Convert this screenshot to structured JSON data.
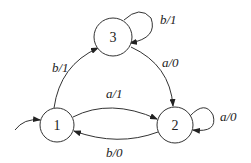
{
  "diagram": {
    "type": "finite-state-machine",
    "states": [
      {
        "id": "1",
        "label": "1",
        "initial": true
      },
      {
        "id": "2",
        "label": "2"
      },
      {
        "id": "3",
        "label": "3"
      }
    ],
    "transitions": [
      {
        "from": "1",
        "to": "3",
        "label": "b/1"
      },
      {
        "from": "3",
        "to": "3",
        "label": "b/1"
      },
      {
        "from": "3",
        "to": "2",
        "label": "a/0"
      },
      {
        "from": "1",
        "to": "2",
        "label": "a/1"
      },
      {
        "from": "2",
        "to": "2",
        "label": "a/0"
      },
      {
        "from": "2",
        "to": "1",
        "label": "b/0"
      }
    ]
  }
}
